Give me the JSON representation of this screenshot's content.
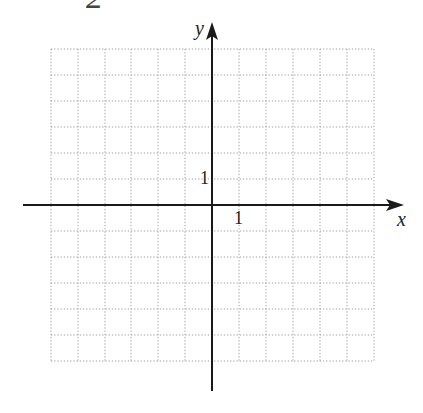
{
  "header": {
    "fragment_label": "2"
  },
  "axes": {
    "x_label": "x",
    "y_label": "y",
    "x_tick_label": "1",
    "y_tick_label": "1"
  },
  "grid": {
    "columns": 12,
    "rows": 12,
    "x_min": -6,
    "x_max": 6,
    "y_min": -6,
    "y_max": 6,
    "line_style": "dotted",
    "line_color": "#9a9a9a",
    "axis_color": "#1a1a1a"
  }
}
